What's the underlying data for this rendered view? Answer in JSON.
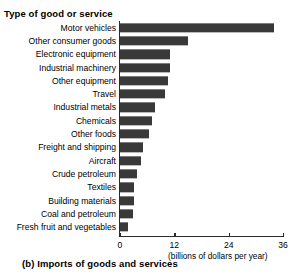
{
  "figure": {
    "caption": "(b) Imports of goods and services",
    "category_axis_title": "Type of good or service",
    "value_axis_unit": "(billions of dollars per year)"
  },
  "chart_data": {
    "type": "bar",
    "orientation": "horizontal",
    "title": "(b) Imports of goods and services",
    "xlabel": "(billions of dollars per year)",
    "ylabel": "Type of good or service",
    "xlim": [
      0,
      36
    ],
    "ylim": null,
    "grid": false,
    "legend": null,
    "bar_color": "#393939",
    "axis_color": "#2b2b2b",
    "ticks": [
      {
        "value": 0,
        "label": "0"
      },
      {
        "value": 12,
        "label": "12"
      },
      {
        "value": 24,
        "label": "24"
      },
      {
        "value": 36,
        "label": "36"
      }
    ],
    "categories": [
      "Motor vehicles",
      "Other consumer goods",
      "Electronic equipment",
      "Industrial machinery",
      "Other equipment",
      "Travel",
      "Industrial metals",
      "Chemicals",
      "Other foods",
      "Freight and shipping",
      "Aircraft",
      "Crude petroleum",
      "Textiles",
      "Building materials",
      "Coal and petroleum",
      "Fresh fruit and vegetables"
    ],
    "values": [
      34,
      15,
      11,
      11,
      10.5,
      10,
      7.8,
      7,
      6.5,
      5,
      4.6,
      3.8,
      3.1,
      3.1,
      2.9,
      1.8
    ]
  }
}
